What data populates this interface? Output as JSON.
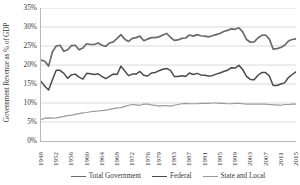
{
  "chart_data": {
    "type": "line",
    "title": "",
    "xlabel": "",
    "ylabel": "Government Revenue as % of GDP",
    "ylim": [
      0,
      35
    ],
    "yticks": [
      "0%",
      "5%",
      "10%",
      "15%",
      "20%",
      "25%",
      "30%",
      "35%"
    ],
    "ytick_values": [
      0,
      5,
      10,
      15,
      20,
      25,
      30,
      35
    ],
    "grid": true,
    "grid_axis": "y",
    "legend_position": "bottom",
    "xlim": [
      1948,
      2015
    ],
    "xticks": [
      "1948",
      "1952",
      "1956",
      "1960",
      "1964",
      "1968",
      "1972",
      "1976",
      "1979",
      "1983",
      "1987",
      "1991",
      "1995",
      "1999",
      "2003",
      "2007",
      "2011",
      "2015"
    ],
    "xtick_values": [
      1948,
      1952,
      1956,
      1960,
      1964,
      1968,
      1972,
      1976,
      1979,
      1983,
      1987,
      1991,
      1995,
      1999,
      2003,
      2007,
      2011,
      2015
    ],
    "x": [
      1948,
      1949,
      1950,
      1951,
      1952,
      1953,
      1954,
      1955,
      1956,
      1957,
      1958,
      1959,
      1960,
      1961,
      1962,
      1963,
      1964,
      1965,
      1966,
      1967,
      1968,
      1969,
      1970,
      1971,
      1972,
      1973,
      1974,
      1975,
      1976,
      1977,
      1978,
      1979,
      1980,
      1981,
      1982,
      1983,
      1984,
      1985,
      1986,
      1987,
      1988,
      1989,
      1990,
      1991,
      1992,
      1993,
      1994,
      1995,
      1996,
      1997,
      1998,
      1999,
      2000,
      2001,
      2002,
      2003,
      2004,
      2005,
      2006,
      2007,
      2008,
      2009,
      2010,
      2011,
      2012,
      2013,
      2014,
      2015
    ],
    "series": [
      {
        "name": "Total Government",
        "color": "#6b6b6b",
        "width": 1.7,
        "values": [
          21.3,
          21.0,
          19.7,
          23.5,
          25.0,
          25.2,
          23.6,
          24.0,
          25.1,
          25.2,
          24.0,
          24.5,
          25.6,
          25.4,
          25.4,
          25.8,
          25.2,
          24.9,
          25.8,
          26.1,
          27.0,
          28.0,
          26.8,
          26.2,
          27.0,
          27.2,
          27.6,
          26.4,
          26.8,
          27.2,
          27.2,
          27.4,
          27.9,
          28.3,
          27.3,
          26.5,
          26.6,
          27.0,
          27.1,
          27.9,
          27.6,
          28.0,
          27.7,
          27.6,
          27.4,
          27.7,
          28.0,
          28.3,
          28.8,
          29.1,
          29.5,
          29.4,
          29.8,
          28.7,
          26.7,
          26.0,
          26.1,
          27.1,
          27.8,
          27.9,
          26.8,
          24.2,
          24.3,
          24.6,
          25.2,
          26.3,
          26.7,
          26.9
        ]
      },
      {
        "name": "Federal",
        "color": "#4a4a4a",
        "width": 1.5,
        "values": [
          15.7,
          14.4,
          13.4,
          16.1,
          18.6,
          18.6,
          17.8,
          16.5,
          17.4,
          17.6,
          16.8,
          16.3,
          17.8,
          17.7,
          17.5,
          17.7,
          17.0,
          16.4,
          17.0,
          17.6,
          17.5,
          19.7,
          18.4,
          17.2,
          17.6,
          17.6,
          18.3,
          17.3,
          17.1,
          17.9,
          18.0,
          18.5,
          18.9,
          19.1,
          18.6,
          17.0,
          17.0,
          17.2,
          17.0,
          17.9,
          17.5,
          17.8,
          17.4,
          17.3,
          17.1,
          17.2,
          17.6,
          17.9,
          18.3,
          18.6,
          19.3,
          19.2,
          19.9,
          18.8,
          17.0,
          16.2,
          16.1,
          17.3,
          18.0,
          18.0,
          17.1,
          14.6,
          14.6,
          15.0,
          15.3,
          16.7,
          17.5,
          18.2
        ]
      },
      {
        "name": "State and Local",
        "color": "#9a9a9a",
        "width": 1.2,
        "values": [
          5.6,
          6.0,
          6.1,
          6.0,
          6.1,
          6.3,
          6.5,
          6.7,
          6.8,
          7.0,
          7.2,
          7.4,
          7.5,
          7.7,
          7.8,
          7.9,
          8.0,
          8.1,
          8.3,
          8.5,
          8.7,
          8.8,
          9.1,
          9.4,
          9.6,
          9.5,
          9.4,
          9.7,
          9.7,
          9.5,
          9.4,
          9.2,
          9.3,
          9.3,
          9.2,
          9.4,
          9.6,
          9.8,
          9.9,
          9.8,
          9.8,
          9.8,
          9.9,
          9.9,
          9.9,
          10.0,
          10.0,
          9.9,
          9.9,
          9.8,
          9.8,
          9.9,
          9.9,
          9.8,
          9.7,
          9.7,
          9.7,
          9.7,
          9.7,
          9.7,
          9.6,
          9.5,
          9.5,
          9.4,
          9.6,
          9.6,
          9.7,
          9.7
        ]
      }
    ],
    "legend": [
      {
        "label": "Total Government",
        "color": "#6b6b6b",
        "width": 1.7
      },
      {
        "label": "Federal",
        "color": "#4a4a4a",
        "width": 1.5
      },
      {
        "label": "State and Local",
        "color": "#9a9a9a",
        "width": 1.2
      }
    ],
    "gridline_color": "#d0d0d0",
    "axis_color": "#b9b9b9"
  }
}
